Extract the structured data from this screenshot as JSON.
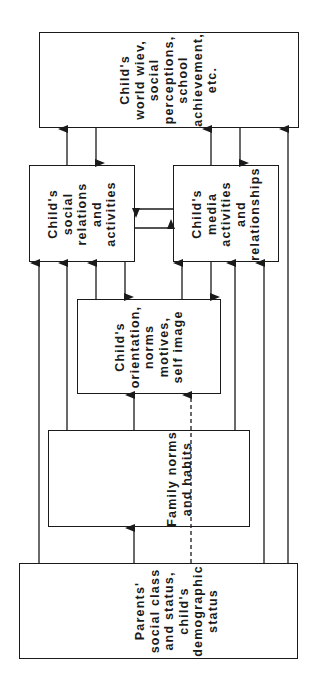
{
  "diagram": {
    "orientation": "rotated-90-ccw",
    "nodes": {
      "world_view": {
        "lines": [
          "Child's",
          "world wiev,",
          "social",
          "perceptions,",
          "school",
          "achievement,",
          "etc."
        ]
      },
      "social": {
        "lines": [
          "Child's",
          "social",
          "relations",
          "and",
          "activities"
        ]
      },
      "media": {
        "lines": [
          "Child's",
          "media",
          "activities",
          "and",
          "relationships"
        ]
      },
      "orientation": {
        "lines": [
          "Child's",
          "orientation,",
          "norms",
          "motives,",
          "self image"
        ]
      },
      "family": {
        "lines": [
          "Family norms",
          "and habits"
        ]
      },
      "parents": {
        "lines": [
          "Parents'",
          "social class",
          "and status,",
          "child's",
          "demographic",
          "status"
        ]
      }
    },
    "edges": [
      {
        "from": "social",
        "to": "world_view",
        "style": "solid"
      },
      {
        "from": "world_view",
        "to": "social",
        "style": "solid"
      },
      {
        "from": "media",
        "to": "world_view",
        "style": "solid"
      },
      {
        "from": "world_view",
        "to": "media",
        "style": "solid"
      },
      {
        "from": "parents",
        "to": "world_view",
        "style": "solid"
      },
      {
        "from": "media",
        "to": "social",
        "style": "solid"
      },
      {
        "from": "social",
        "to": "media",
        "style": "solid"
      },
      {
        "from": "parents",
        "to": "social",
        "style": "solid"
      },
      {
        "from": "family",
        "to": "social",
        "style": "solid"
      },
      {
        "from": "orientation",
        "to": "social",
        "style": "solid"
      },
      {
        "from": "social",
        "to": "orientation",
        "style": "solid"
      },
      {
        "from": "orientation",
        "to": "media",
        "style": "solid"
      },
      {
        "from": "media",
        "to": "orientation",
        "style": "solid"
      },
      {
        "from": "family",
        "to": "media",
        "style": "solid"
      },
      {
        "from": "parents",
        "to": "media",
        "style": "solid"
      },
      {
        "from": "family",
        "to": "orientation",
        "style": "solid"
      },
      {
        "from": "parents",
        "to": "orientation",
        "style": "dashed"
      },
      {
        "from": "parents",
        "to": "family",
        "style": "solid"
      }
    ],
    "colors": {
      "stroke": "#1a1a1a",
      "background": "#ffffff"
    }
  }
}
